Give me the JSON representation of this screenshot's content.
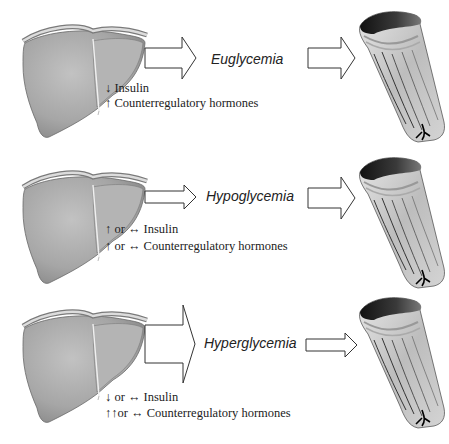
{
  "figure": {
    "colors": {
      "liver_fill": "#a8a8a8",
      "liver_highlight": "#c4c4c4",
      "arrow_stroke": "#333333",
      "arrow_fill": "#ffffff",
      "text": "#222222"
    },
    "rows": [
      {
        "state": "Euglycemia",
        "hormone_lines": [
          "↓ Insulin",
          "↑ Counterregulatory hormones"
        ],
        "liver_arrow_size": "medium"
      },
      {
        "state": "Hypoglycemia",
        "hormone_lines": [
          "↑ or ↔ Insulin",
          "↑ or ↔ Counterregulatory hormones"
        ],
        "liver_arrow_size": "small"
      },
      {
        "state": "Hyperglycemia",
        "hormone_lines": [
          "↓ or ↔ Insulin",
          "↑↑or ↔ Counterregulatory hormones"
        ],
        "liver_arrow_size": "large"
      }
    ]
  }
}
